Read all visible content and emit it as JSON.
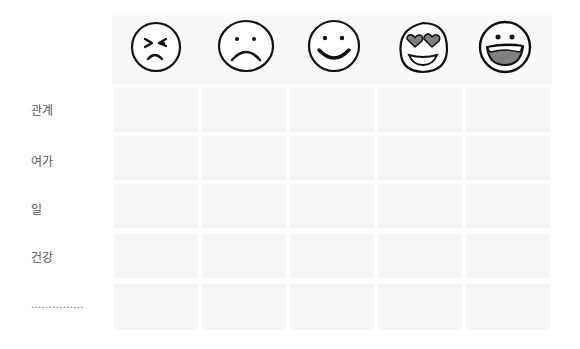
{
  "header": {
    "emojis": [
      {
        "name": "angry-face",
        "label": "angry"
      },
      {
        "name": "sad-face",
        "label": "sad"
      },
      {
        "name": "smiling-face",
        "label": "happy"
      },
      {
        "name": "heart-eyes-face",
        "label": "in love"
      },
      {
        "name": "grinning-face",
        "label": "very happy"
      }
    ]
  },
  "rows": [
    {
      "label": "관계"
    },
    {
      "label": "여가"
    },
    {
      "label": "일"
    },
    {
      "label": "건강"
    },
    {
      "label": "..............."
    }
  ],
  "colors": {
    "cell": "#f5f5f5",
    "header": "#f8f8f8",
    "stroke": "#111111",
    "fill_gray": "#808080"
  }
}
